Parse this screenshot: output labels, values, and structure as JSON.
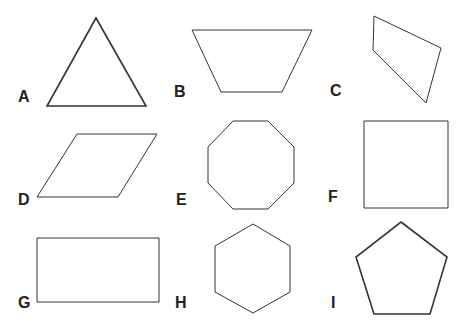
{
  "figure": {
    "shapes": [
      {
        "label": "A",
        "name": "equilateral triangle",
        "points": "96,18 146,106 47,106",
        "stroke_width": 1.6,
        "label_pos": [
          18,
          101
        ]
      },
      {
        "label": "B",
        "name": "trapezoid",
        "points": "192,30 312,30 282,92 221,92",
        "stroke_width": 1.0,
        "label_pos": [
          174,
          96
        ]
      },
      {
        "label": "C",
        "name": "irregular quadrilateral (kite)",
        "points": "374,16 441,48 426,103 373,50",
        "stroke_width": 1.0,
        "label_pos": [
          330,
          95
        ]
      },
      {
        "label": "D",
        "name": "parallelogram (rhombus)",
        "points": "77,134 157,134 118,197 37,197",
        "stroke_width": 1.0,
        "label_pos": [
          18,
          204
        ]
      },
      {
        "label": "E",
        "name": "regular octagon",
        "points": "233,121 268,121 294,147 294,183 268,209 233,209 208,183 208,147",
        "stroke_width": 1.0,
        "label_pos": [
          176,
          204
        ]
      },
      {
        "label": "F",
        "name": "square",
        "points": "364,121 448,121 448,208 364,208",
        "stroke_width": 1.0,
        "label_pos": [
          328,
          201
        ]
      },
      {
        "label": "G",
        "name": "rectangle",
        "points": "37,238 159,238 159,302 37,302",
        "stroke_width": 1.0,
        "label_pos": [
          18,
          307
        ]
      },
      {
        "label": "H",
        "name": "regular hexagon",
        "points": "253,224 290,246 290,292 253,313 215,292 215,246",
        "stroke_width": 1.0,
        "label_pos": [
          175,
          307
        ]
      },
      {
        "label": "I",
        "name": "regular pentagon",
        "points": "401,222 447,257 430,314 374,314 356,257",
        "stroke_width": 1.6,
        "label_pos": [
          331,
          307
        ]
      }
    ]
  },
  "colors": {
    "background": "#ffffff",
    "stroke": "#333333",
    "label": "#222222"
  }
}
